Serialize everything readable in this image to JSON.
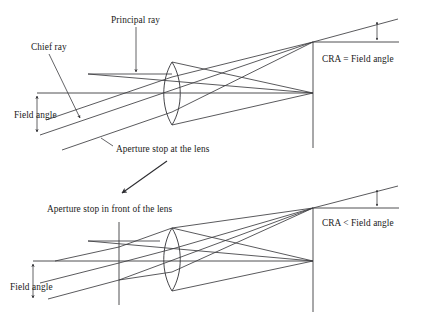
{
  "figure": {
    "stroke_color": "#3c3c40",
    "text_color": "#1a1a1a",
    "background": "#ffffff"
  },
  "top_diagram": {
    "caption": "Aperture stop at the lens",
    "labels": {
      "principal_ray": "Principal ray",
      "chief_ray": "Chief ray",
      "field_angle": "Field angle",
      "cra_relation": "CRA = Field angle"
    }
  },
  "bottom_diagram": {
    "caption": "Aperture stop in front of the lens",
    "labels": {
      "field_angle": "Field angle",
      "cra_relation": "CRA < Field angle"
    }
  },
  "icons": {
    "transition_arrow": "diagonal-arrow-icon",
    "principal_ray_pointer": "down-arrow-icon",
    "chief_ray_pointer": "down-arrow-icon",
    "field_angle_dimension": "double-headed-arrow-icon",
    "cra_dimension": "double-headed-arrow-icon"
  }
}
